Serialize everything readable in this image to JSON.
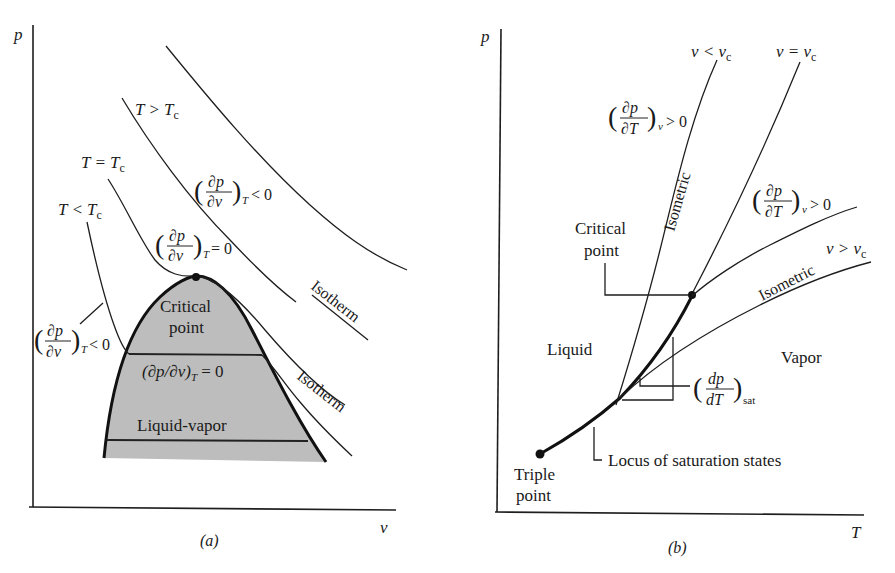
{
  "figure": {
    "panel_a": {
      "caption": "(a)",
      "x_axis_label": "v",
      "y_axis_label": "p",
      "isotherm_labels": {
        "above_critical": "T > T",
        "critical": "T = T",
        "below_critical": "T < T",
        "subscript": "c"
      },
      "derivative_labels": {
        "above": {
          "num": "∂p",
          "den": "∂v",
          "sub": "T",
          "rel": "< 0"
        },
        "critical": {
          "num": "∂p",
          "den": "∂v",
          "sub": "T",
          "rel": "= 0"
        },
        "below": {
          "num": "∂p",
          "den": "∂v",
          "sub": "T",
          "rel": "< 0"
        },
        "inline_zero": "(∂p/∂v)",
        "inline_sub": "T",
        "inline_rel": " = 0"
      },
      "region_labels": {
        "critical_point_line1": "Critical",
        "critical_point_line2": "point",
        "dome": "Liquid-vapor"
      },
      "curve_labels": {
        "isotherm_1": "Isotherm",
        "isotherm_2": "Isotherm"
      },
      "colors": {
        "dome_fill": "#bdbdbd",
        "line": "#1e1e1e"
      }
    },
    "panel_b": {
      "caption": "(b)",
      "x_axis_label": "T",
      "y_axis_label": "p",
      "isometric_labels": {
        "less": "v < v",
        "equal": "v = v",
        "greater": "v > v",
        "subscript": "c",
        "isometric_1": "Isometric",
        "isometric_2": "Isometric"
      },
      "derivative_labels": {
        "upper": {
          "num": "∂p",
          "den": "∂T",
          "sub": "v",
          "rel": "> 0"
        },
        "middle": {
          "num": "∂p",
          "den": "∂T",
          "sub": "v",
          "rel": "> 0"
        },
        "sat": {
          "num": "dp",
          "den": "dT",
          "sub": "sat"
        }
      },
      "region_labels": {
        "liquid": "Liquid",
        "vapor": "Vapor",
        "critical_point_line1": "Critical",
        "critical_point_line2": "point",
        "triple_point_line1": "Triple",
        "triple_point_line2": "point",
        "locus": "Locus of saturation states"
      }
    }
  }
}
